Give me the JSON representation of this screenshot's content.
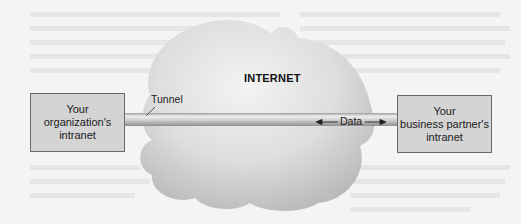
{
  "diagram": {
    "type": "network-vpn-tunnel",
    "cloud": {
      "label": "INTERNET"
    },
    "tunnel": {
      "label": "Tunnel"
    },
    "data_flow": {
      "label": "Data",
      "direction": "bidirectional"
    },
    "left_node": {
      "lines": [
        "Your",
        "organization's",
        "intranet"
      ]
    },
    "right_node": {
      "lines": [
        "Your",
        "business partner's",
        "intranet"
      ]
    },
    "colors": {
      "background": "#f4f4f3",
      "box_fill": "#d4d4d4",
      "box_border": "#6a6a6a",
      "cloud_light": "#f0f0f0",
      "cloud_dark": "#b9b9b9",
      "tunnel_highlight": "#f2f2f2",
      "tunnel_shadow": "#a8a8a8"
    }
  }
}
